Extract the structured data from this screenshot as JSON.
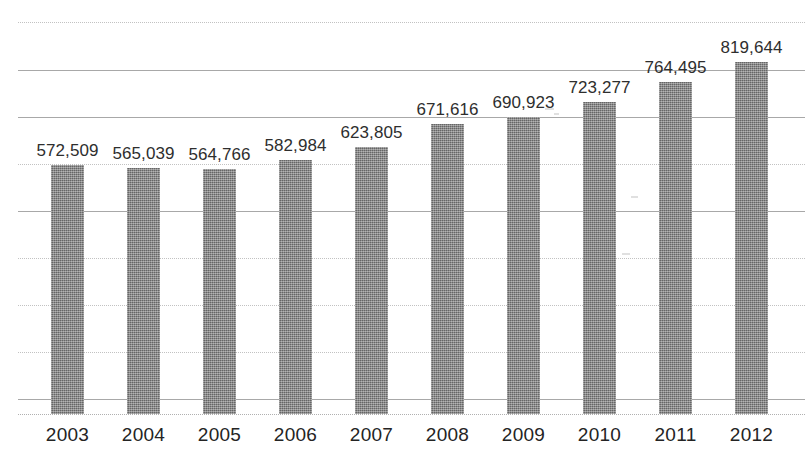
{
  "chart_data": {
    "type": "bar",
    "title": "",
    "subtitle": "",
    "xlabel": "",
    "ylabel": "",
    "categories": [
      "2003",
      "2004",
      "2005",
      "2006",
      "2007",
      "2008",
      "2009",
      "2010",
      "2011",
      "2012"
    ],
    "values": [
      572509,
      565039,
      564766,
      582984,
      623805,
      671616,
      690923,
      723277,
      764495,
      819644
    ],
    "value_labels": [
      "572,509",
      "565,039",
      "564,766",
      "582,984",
      "623,805",
      "671,616",
      "690,923",
      "723,277",
      "764,495",
      "819,644"
    ],
    "series": [
      {
        "name": "",
        "values": [
          572509,
          565039,
          564766,
          582984,
          623805,
          671616,
          690923,
          723277,
          764495,
          819644
        ]
      }
    ],
    "ylim": [
      0,
      1000000
    ],
    "grid": true,
    "grid_lines": 9,
    "legend": false,
    "legend_position": "none",
    "data_labels": true,
    "bar_color": "#7c7c7c",
    "grid_color": "#b9b9b9",
    "text_color": "#2e2e2e",
    "background_color": "#ffffff"
  },
  "geometry": {
    "baseline_y": 414,
    "bar_width": 33,
    "first_bar_x": 51,
    "bar_spacing": 76,
    "grid_y": [
      22,
      70,
      117,
      164,
      211,
      258,
      305,
      352,
      399
    ],
    "grid_style": [
      "dotted",
      "solid",
      "solid",
      "dotted",
      "solid",
      "dotted",
      "dotted",
      "dotted",
      "solid"
    ],
    "bar_tops": [
      165,
      168,
      169,
      160,
      147,
      124,
      117,
      102,
      82,
      62
    ]
  }
}
